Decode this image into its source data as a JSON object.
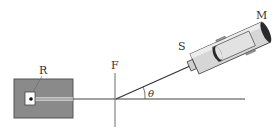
{
  "diagram": {
    "type": "physics-apparatus",
    "labels": {
      "R": "R",
      "F": "F",
      "S": "S",
      "M": "M",
      "angle": "θ"
    },
    "colors": {
      "box_fill": "#8a8a8a",
      "line": "#444444",
      "tube_fill": "#d8d8d8",
      "tube_dark": "#3a3a3a",
      "background": "#ffffff"
    }
  }
}
